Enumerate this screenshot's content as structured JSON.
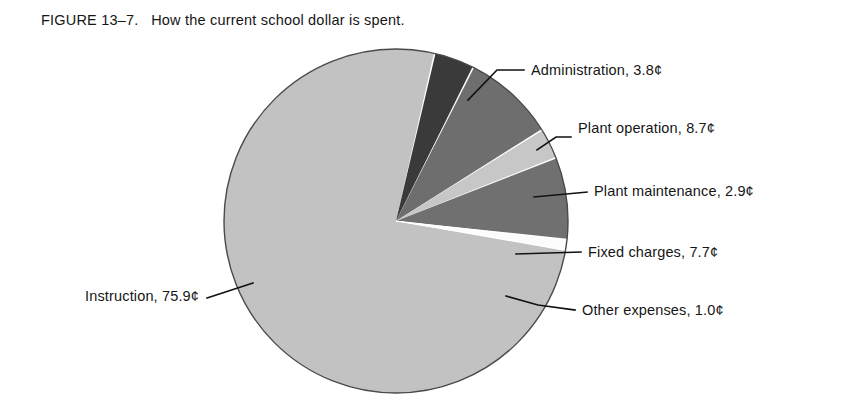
{
  "figure": {
    "number_label": "FIGURE 13–7.",
    "caption": "How the current school dollar is spent.",
    "full_caption": "FIGURE 13–7.   How the current school dollar is spent."
  },
  "chart_data": {
    "type": "pie",
    "title": "How the current school dollar is spent.",
    "unit": "¢",
    "total": 100.0,
    "legend": "none (direct labels with leader lines)",
    "grid": false,
    "categories": [
      "Instruction",
      "Administration",
      "Plant operation",
      "Plant maintenance",
      "Fixed charges",
      "Other expenses"
    ],
    "values": [
      75.9,
      3.8,
      8.7,
      2.9,
      7.7,
      1.0
    ],
    "labels": [
      "Instruction, 75.9¢",
      "Administration, 3.8¢",
      "Plant operation, 8.7¢",
      "Plant maintenance, 2.9¢",
      "Fixed charges, 7.7¢",
      "Other expenses, 1.0¢"
    ],
    "slices": [
      {
        "name": "administration",
        "label": "Administration, 3.8¢",
        "category": "Administration",
        "value": 3.8,
        "color": "#3a3a3a",
        "label_x": 531,
        "label_y": 75
      },
      {
        "name": "plant-operation",
        "label": "Plant operation, 8.7¢",
        "category": "Plant operation",
        "value": 8.7,
        "color": "#6e6e6e",
        "label_x": 578,
        "label_y": 133
      },
      {
        "name": "plant-maintenance",
        "label": "Plant maintenance, 2.9¢",
        "category": "Plant maintenance",
        "value": 2.9,
        "color": "#c7c7c7",
        "label_x": 594,
        "label_y": 196
      },
      {
        "name": "fixed-charges",
        "label": "Fixed charges, 7.7¢",
        "category": "Fixed charges",
        "value": 7.7,
        "color": "#707070",
        "label_x": 588,
        "label_y": 256
      },
      {
        "name": "other-expenses",
        "label": "Other expenses, 1.0¢",
        "category": "Other expenses",
        "value": 1.0,
        "color": "#fcfcfc",
        "label_x": 582,
        "label_y": 314
      },
      {
        "name": "instruction",
        "label": "Instruction, 75.9¢",
        "category": "Instruction",
        "value": 75.9,
        "color": "#c2c2c2",
        "label_x": 35,
        "label_y": 296
      }
    ],
    "colors": {
      "instruction": "#c2c2c2",
      "administration": "#3a3a3a",
      "plant_operation": "#6e6e6e",
      "plant_maintenance": "#c7c7c7",
      "fixed_charges": "#707070",
      "other_expenses": "#fcfcfc",
      "outline": "#4a4a4a",
      "leader_line": "#111111",
      "background": "#ffffff",
      "text": "#161616"
    }
  }
}
